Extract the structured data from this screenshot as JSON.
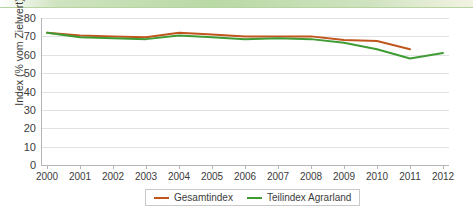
{
  "chart_data": {
    "type": "line",
    "title": "",
    "xlabel": "",
    "ylabel": "Index (% vom Zielwert)",
    "x": [
      2000,
      2001,
      2002,
      2003,
      2004,
      2005,
      2006,
      2007,
      2008,
      2009,
      2010,
      2011,
      2012
    ],
    "categories": [
      "2000",
      "2001",
      "2002",
      "2003",
      "2004",
      "2005",
      "2006",
      "2007",
      "2008",
      "2009",
      "2010",
      "2011",
      "2012"
    ],
    "xlim": [
      2000,
      2012
    ],
    "ylim": [
      0,
      80
    ],
    "yticks": [
      0,
      10,
      20,
      30,
      40,
      50,
      60,
      70,
      80
    ],
    "ytick_labels": [
      "0",
      "10",
      "20",
      "30",
      "40",
      "50",
      "60",
      "70",
      "80"
    ],
    "grid": true,
    "legend_position": "bottom",
    "series": [
      {
        "name": "Gesamtindex",
        "color": "#c0561e",
        "x": [
          2000,
          2001,
          2002,
          2003,
          2004,
          2005,
          2006,
          2007,
          2008,
          2009,
          2010,
          2011
        ],
        "values": [
          72,
          70.5,
          70,
          69.5,
          72,
          71,
          70,
          70,
          70,
          68,
          67.5,
          63
        ]
      },
      {
        "name": "Teilindex Agrarland",
        "color": "#3f9c35",
        "x": [
          2000,
          2001,
          2002,
          2003,
          2004,
          2005,
          2006,
          2007,
          2008,
          2009,
          2010,
          2011,
          2012
        ],
        "values": [
          72,
          69.5,
          69,
          68.5,
          70.5,
          69.5,
          68.5,
          69,
          68.5,
          66.5,
          63,
          58,
          61
        ]
      }
    ]
  },
  "legend": {
    "items": [
      {
        "label": "Gesamtindex",
        "color": "#c0561e"
      },
      {
        "label": "Teilindex Agrarland",
        "color": "#3f9c35"
      }
    ]
  },
  "colors": {
    "gridline": "#e2e2e2",
    "axis": "#b5b5b5",
    "text": "#3c3c3c",
    "band": "#b9d9a5"
  }
}
